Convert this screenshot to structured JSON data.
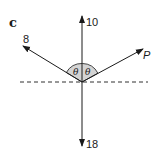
{
  "figure": {
    "part_label": "c",
    "colors": {
      "ink": "#1a1a1a",
      "angle_fill": "#d4d4d4",
      "background": "#ffffff"
    },
    "reference_line": {
      "style": "dashed",
      "orientation": "horizontal"
    },
    "forces": [
      {
        "id": "up",
        "label": "10",
        "direction": "vertical up"
      },
      {
        "id": "down",
        "label": "18",
        "direction": "vertical down"
      },
      {
        "id": "upper-left",
        "label": "8",
        "direction": "up-left"
      },
      {
        "id": "upper-right",
        "label": "P",
        "direction": "up-right"
      }
    ],
    "angles": [
      {
        "label": "θ",
        "between": "upper-left force and vertical"
      },
      {
        "label": "θ",
        "between": "vertical and upper-right force"
      }
    ]
  }
}
